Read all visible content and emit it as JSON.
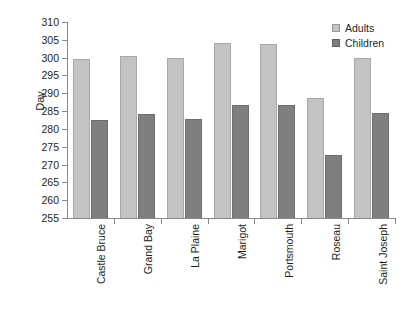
{
  "chart_data": {
    "type": "bar",
    "title": "",
    "xlabel": "",
    "ylabel": "Day",
    "ylim": [
      255,
      310
    ],
    "ytick_step": 5,
    "yticks": [
      255,
      260,
      265,
      270,
      275,
      280,
      285,
      290,
      295,
      300,
      305,
      310
    ],
    "grid": false,
    "legend_position": "top-right",
    "categories": [
      "Castle Bruce",
      "Grand Bay",
      "La Plaine",
      "Marigot",
      "Portsmouth",
      "Roseau",
      "Saint Joseph"
    ],
    "series": [
      {
        "name": "Adults",
        "color": "#c3c3c3",
        "values": [
          299.7,
          300.5,
          299.8,
          304.2,
          303.9,
          288.8,
          299.8
        ]
      },
      {
        "name": "Children",
        "color": "#7f7f7f",
        "values": [
          282.5,
          284.3,
          282.7,
          286.8,
          286.7,
          272.8,
          284.5
        ]
      }
    ]
  },
  "legend": {
    "items": [
      {
        "label": "Adults"
      },
      {
        "label": "Children"
      }
    ]
  },
  "axis": {
    "y_title": "Day"
  }
}
